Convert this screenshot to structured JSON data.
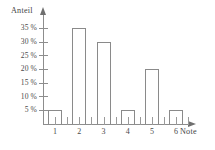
{
  "chart_data": {
    "type": "bar",
    "title": "",
    "subtitle": "",
    "xlabel": "Note",
    "ylabel": "Anteil",
    "categories": [
      "1",
      "2",
      "3",
      "4",
      "5",
      "6"
    ],
    "values": [
      5,
      35,
      30,
      5,
      20,
      5
    ],
    "value_suffix": "%",
    "ylim": [
      0,
      37
    ],
    "xlim": [
      0.5,
      6.5
    ],
    "yticks": [
      5,
      10,
      15,
      20,
      25,
      30,
      35
    ],
    "ytick_labels": [
      "5 %",
      "10 %",
      "15 %",
      "20 %",
      "25 %",
      "30 %",
      "35 %"
    ],
    "xtick_labels": [
      "1",
      "2",
      "3",
      "4",
      "5",
      "6"
    ],
    "grid": false,
    "legend": false,
    "legend_position": "none",
    "bar_style": "outline",
    "axis_arrows": true,
    "colors": {
      "bar_outline": "#8a8a8a",
      "bar_fill": "transparent",
      "axis": "#8d8d8d",
      "text": "#4a4a4a",
      "background": "#ffffff"
    },
    "annotations": []
  },
  "axes": {
    "y_title": "Anteil",
    "x_title": "Note"
  }
}
